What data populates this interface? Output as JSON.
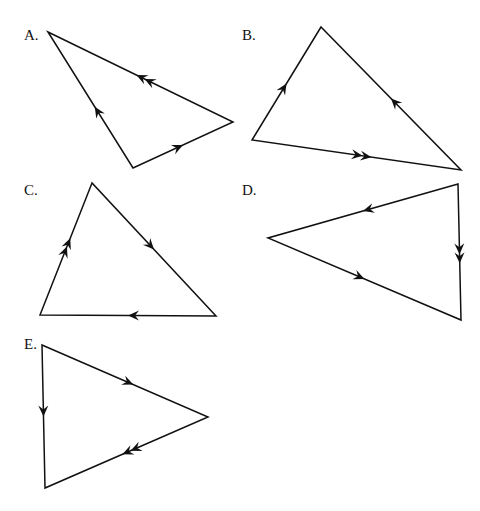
{
  "figure": {
    "triangles": [
      {
        "id": "A",
        "label": "A.",
        "label_pos": [
          24,
          40
        ],
        "vertices": [
          [
            48,
            32
          ],
          [
            233,
            122
          ],
          [
            133,
            168
          ]
        ],
        "edges": [
          {
            "from": 1,
            "to": 0,
            "arrows": 2,
            "t": 0.5
          },
          {
            "from": 2,
            "to": 0,
            "arrows": 1,
            "t": 0.45
          },
          {
            "from": 2,
            "to": 1,
            "arrows": 1,
            "t": 0.5
          }
        ]
      },
      {
        "id": "B",
        "label": "B.",
        "label_pos": [
          242,
          40
        ],
        "vertices": [
          [
            321,
            27
          ],
          [
            252,
            140
          ],
          [
            461,
            170
          ]
        ],
        "edges": [
          {
            "from": 1,
            "to": 0,
            "arrows": 1,
            "t": 0.5
          },
          {
            "from": 2,
            "to": 0,
            "arrows": 1,
            "t": 0.5
          },
          {
            "from": 1,
            "to": 2,
            "arrows": 2,
            "t": 0.55
          }
        ]
      },
      {
        "id": "C",
        "label": "C.",
        "label_pos": [
          24,
          195
        ],
        "vertices": [
          [
            92,
            183
          ],
          [
            40,
            315
          ],
          [
            216,
            316
          ]
        ],
        "edges": [
          {
            "from": 1,
            "to": 0,
            "arrows": 2,
            "t": 0.55
          },
          {
            "from": 0,
            "to": 2,
            "arrows": 1,
            "t": 0.5
          },
          {
            "from": 2,
            "to": 1,
            "arrows": 1,
            "t": 0.5
          }
        ]
      },
      {
        "id": "D",
        "label": "D.",
        "label_pos": [
          242,
          195
        ],
        "vertices": [
          [
            458,
            184
          ],
          [
            268,
            238
          ],
          [
            461,
            320
          ]
        ],
        "edges": [
          {
            "from": 0,
            "to": 1,
            "arrows": 1,
            "t": 0.5
          },
          {
            "from": 0,
            "to": 2,
            "arrows": 2,
            "t": 0.55
          },
          {
            "from": 1,
            "to": 2,
            "arrows": 1,
            "t": 0.5
          }
        ]
      },
      {
        "id": "E",
        "label": "E.",
        "label_pos": [
          24,
          349
        ],
        "vertices": [
          [
            42,
            345
          ],
          [
            208,
            417
          ],
          [
            45,
            488
          ]
        ],
        "edges": [
          {
            "from": 0,
            "to": 1,
            "arrows": 1,
            "t": 0.55
          },
          {
            "from": 1,
            "to": 2,
            "arrows": 2,
            "t": 0.5
          },
          {
            "from": 0,
            "to": 2,
            "arrows": 1,
            "t": 0.5
          }
        ]
      }
    ]
  }
}
